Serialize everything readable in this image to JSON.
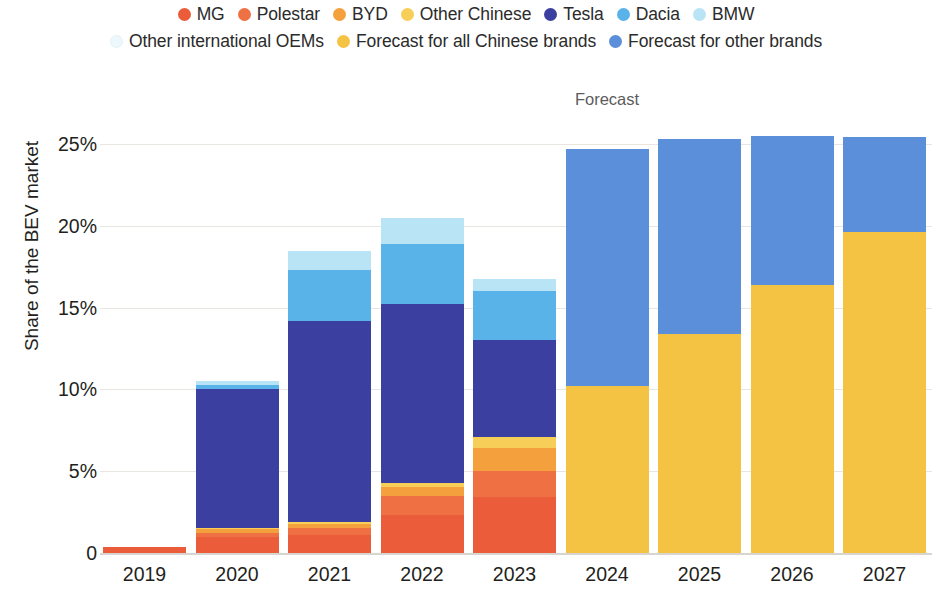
{
  "legend": {
    "rows": [
      [
        {
          "label": "MG",
          "color": "#ea5c3a",
          "name": "legend-dot-mg"
        },
        {
          "label": "Polestar",
          "color": "#ef7043",
          "name": "legend-dot-polestar"
        },
        {
          "label": "BYD",
          "color": "#f4a03c",
          "name": "legend-dot-byd"
        },
        {
          "label": "Other Chinese",
          "color": "#f7ce58",
          "name": "legend-dot-other-chinese"
        },
        {
          "label": "Tesla",
          "color": "#3b3fa0",
          "name": "legend-dot-tesla"
        },
        {
          "label": "Dacia",
          "color": "#59b2e8",
          "name": "legend-dot-dacia"
        },
        {
          "label": "BMW",
          "color": "#b9e4f5",
          "name": "legend-dot-bmw"
        }
      ],
      [
        {
          "label": "Other international OEMs",
          "color": "#edf8fc",
          "name": "legend-dot-other-international-oems"
        },
        {
          "label": "Forecast for all Chinese brands",
          "color": "#f5c344",
          "name": "legend-dot-forecast-chinese"
        },
        {
          "label": "Forecast for other brands",
          "color": "#5b8fd9",
          "name": "legend-dot-forecast-other"
        }
      ]
    ]
  },
  "axes": {
    "ylabel": "Share of the BEV market",
    "yticks": [
      "25%",
      "20%",
      "15%",
      "10%",
      "5%",
      "0"
    ],
    "ytick_values": [
      25,
      20,
      15,
      10,
      5,
      0
    ],
    "xticks": [
      "2019",
      "2020",
      "2021",
      "2022",
      "2023",
      "2024",
      "2025",
      "2026",
      "2027"
    ]
  },
  "annotations": {
    "forecast": "Forecast"
  },
  "chart_data": {
    "type": "bar",
    "stacked": true,
    "title": "",
    "xlabel": "",
    "ylabel": "Share of the BEV market",
    "ylim": [
      0,
      26.5
    ],
    "grid": true,
    "legend_position": "top",
    "categories": [
      "2019",
      "2020",
      "2021",
      "2022",
      "2023",
      "2024",
      "2025",
      "2026",
      "2027"
    ],
    "series": [
      {
        "name": "MG",
        "color": "#ea5c3a",
        "values": [
          0.35,
          1.0,
          1.1,
          2.3,
          3.4,
          0,
          0,
          0,
          0
        ]
      },
      {
        "name": "Polestar",
        "color": "#ef7043",
        "values": [
          0,
          0.25,
          0.45,
          1.2,
          1.6,
          0,
          0,
          0,
          0
        ]
      },
      {
        "name": "BYD",
        "color": "#f4a03c",
        "values": [
          0,
          0.2,
          0.25,
          0.55,
          1.4,
          0,
          0,
          0,
          0
        ]
      },
      {
        "name": "Other Chinese",
        "color": "#f7ce58",
        "values": [
          0,
          0.05,
          0.1,
          0.25,
          0.7,
          0,
          0,
          0,
          0
        ]
      },
      {
        "name": "Tesla",
        "color": "#3b3fa0",
        "values": [
          0,
          8.5,
          12.3,
          10.9,
          5.9,
          0,
          0,
          0,
          0
        ]
      },
      {
        "name": "Dacia",
        "color": "#59b2e8",
        "values": [
          0,
          0.25,
          3.1,
          3.7,
          3.0,
          0,
          0,
          0,
          0
        ]
      },
      {
        "name": "BMW",
        "color": "#b9e4f5",
        "values": [
          0,
          0.25,
          1.15,
          1.6,
          0.75,
          0,
          0,
          0,
          0
        ]
      },
      {
        "name": "Other international OEMs",
        "color": "#edf8fc",
        "values": [
          0,
          0,
          0,
          0,
          0,
          0,
          0,
          0,
          0
        ]
      },
      {
        "name": "Forecast for all Chinese brands",
        "color": "#f5c344",
        "values": [
          0,
          0,
          0,
          0,
          0,
          10.2,
          13.4,
          16.4,
          19.6
        ]
      },
      {
        "name": "Forecast for other brands",
        "color": "#5b8fd9",
        "values": [
          0,
          0,
          0,
          0,
          0,
          14.5,
          11.9,
          9.1,
          5.8
        ]
      }
    ],
    "totals": [
      0.35,
      10.5,
      18.45,
      20.5,
      16.75,
      24.7,
      25.3,
      25.5,
      25.4
    ],
    "forecast_start_category": "2024"
  },
  "geometry": {
    "plot_left": 100,
    "plot_right": 932,
    "baseline_y": 553,
    "px_per_percent": 16.36,
    "bar_width": 83,
    "bar_pitch": 92.5,
    "first_bar_left": 103,
    "xtick_bottom": 5
  }
}
